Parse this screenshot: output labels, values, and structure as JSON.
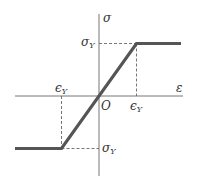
{
  "diagram": {
    "axes": {
      "x_label": "ε",
      "y_label": "σ",
      "origin_label": "O"
    },
    "labels": {
      "sigma_y_top": {
        "main": "σ",
        "sub": "Y"
      },
      "sigma_y_bottom": {
        "main": "σ",
        "sub": "Y"
      },
      "epsilon_y_right": {
        "main": "ϵ",
        "sub": "Y"
      },
      "epsilon_y_left": {
        "main": "ϵ",
        "sub": "Y"
      }
    },
    "model": {
      "yield_strain": 1,
      "yield_stress": 1,
      "x_range": [
        -2.3,
        2.3
      ],
      "y_range": [
        -1.5,
        1.5
      ]
    },
    "colors": {
      "curve": "#555555",
      "axis": "#777777",
      "dash": "#666666",
      "text": "#333333"
    }
  }
}
